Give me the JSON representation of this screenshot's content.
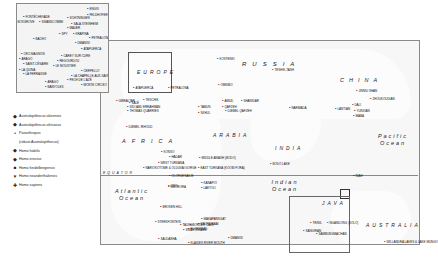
{
  "legend": {
    "items": [
      {
        "symbol": "◆",
        "label": "Australopithecus afarensis"
      },
      {
        "symbol": "◆",
        "label": "Australopithecus africanus"
      },
      {
        "symbol": "•",
        "label": "Paranthropus"
      },
      {
        "symbol": "",
        "label": "(robust Australopithecus)"
      },
      {
        "symbol": "◆",
        "label": "Homo habilis"
      },
      {
        "symbol": "◆",
        "label": "Homo erectus"
      },
      {
        "symbol": "■",
        "label": "Homo heidelbergensis"
      },
      {
        "symbol": "▼",
        "label": "Homo neanderthalensis"
      },
      {
        "symbol": "✚",
        "label": "Homo sapiens"
      }
    ]
  },
  "regions": {
    "europe": "EUROPE",
    "russia": "RUSSIA",
    "china": "CHINA",
    "africa": "AFRICA",
    "arabia": "ARABIA",
    "india": "INDIA",
    "java": "JAVA",
    "australia": "AUSTRALIA",
    "equator": "EQUATOR"
  },
  "oceans": {
    "atlantic": "Atlantic Ocean",
    "indian": "Indian Ocean",
    "pacific": "Pacific Ocean"
  },
  "europe_inset_sites": [
    {
      "name": "ENGIS",
      "x": 86,
      "y": 6
    },
    {
      "name": "FELDHOFER",
      "x": 86,
      "y": 12
    },
    {
      "name": "FONTÉCHEVADE",
      "x": 22,
      "y": 14
    },
    {
      "name": "SCHÖNINGEN",
      "x": 66,
      "y": 15
    },
    {
      "name": "BOXGROVE",
      "x": 14,
      "y": 19
    },
    {
      "name": "SWANSCOMBE",
      "x": 38,
      "y": 19
    },
    {
      "name": "SALA STEINHEIM",
      "x": 70,
      "y": 21
    },
    {
      "name": "MAUER",
      "x": 66,
      "y": 25
    },
    {
      "name": "SPY",
      "x": 58,
      "y": 31
    },
    {
      "name": "KRAPINA",
      "x": 72,
      "y": 31
    },
    {
      "name": "PETRALONA",
      "x": 88,
      "y": 35
    },
    {
      "name": "BACHO",
      "x": 32,
      "y": 36
    },
    {
      "name": "DMANISI",
      "x": 74,
      "y": 40
    },
    {
      "name": "ATAPUERCA",
      "x": 80,
      "y": 46
    },
    {
      "name": "CRO-MAGNON",
      "x": 20,
      "y": 51
    },
    {
      "name": "ARAGO",
      "x": 18,
      "y": 56
    },
    {
      "name": "CAREY SUR CURE",
      "x": 60,
      "y": 53
    },
    {
      "name": "REGOURDOU",
      "x": 56,
      "y": 58
    },
    {
      "name": "LE MOUSTIER",
      "x": 52,
      "y": 63
    },
    {
      "name": "SAINT-CÉSAIRE",
      "x": 22,
      "y": 61
    },
    {
      "name": "LA QUINA",
      "x": 18,
      "y": 67
    },
    {
      "name": "LA FERRASSIE",
      "x": 22,
      "y": 71
    },
    {
      "name": "LA CHAPELLE-AUX-SAINTS",
      "x": 70,
      "y": 73
    },
    {
      "name": "PECH DE L'AZÉ",
      "x": 66,
      "y": 77
    },
    {
      "name": "CERPELLO",
      "x": 80,
      "y": 68
    },
    {
      "name": "ARAGO",
      "x": 44,
      "y": 79
    },
    {
      "name": "MONTE CIRCEO",
      "x": 80,
      "y": 82
    },
    {
      "name": "BANYOLES",
      "x": 44,
      "y": 84
    }
  ],
  "sites": [
    {
      "name": "KOSTENKI",
      "x": 217,
      "y": 57
    },
    {
      "name": "PETRALONA",
      "x": 168,
      "y": 86
    },
    {
      "name": "OMNIBO",
      "x": 218,
      "y": 83
    },
    {
      "name": "TESHIK-TASH",
      "x": 272,
      "y": 68
    },
    {
      "name": "ATAPUERCA",
      "x": 133,
      "y": 86
    },
    {
      "name": "GIBRALTAR",
      "x": 116,
      "y": 99
    },
    {
      "name": "TESCHIK",
      "x": 143,
      "y": 98
    },
    {
      "name": "SALÉ",
      "x": 129,
      "y": 101
    },
    {
      "name": "SIDI ABD ERRAHMAN",
      "x": 127,
      "y": 105
    },
    {
      "name": "THOMAS QUARRIES",
      "x": 127,
      "y": 109
    },
    {
      "name": "DJEBEL IRHOUD",
      "x": 126,
      "y": 125
    },
    {
      "name": "AMUD",
      "x": 222,
      "y": 99
    },
    {
      "name": "SHANIDAR",
      "x": 241,
      "y": 99
    },
    {
      "name": "TABUN",
      "x": 198,
      "y": 105
    },
    {
      "name": "SKHUL",
      "x": 198,
      "y": 111
    },
    {
      "name": "QAFZEH",
      "x": 222,
      "y": 105
    },
    {
      "name": "DJEBEL QAFZEH",
      "x": 225,
      "y": 109
    },
    {
      "name": "JINNIU SHAN",
      "x": 356,
      "y": 89
    },
    {
      "name": "ZHOUKOUDIAN",
      "x": 370,
      "y": 97
    },
    {
      "name": "DALI",
      "x": 352,
      "y": 103
    },
    {
      "name": "LANTIAN",
      "x": 335,
      "y": 107
    },
    {
      "name": "YUNXIAN",
      "x": 354,
      "y": 109
    },
    {
      "name": "MABA",
      "x": 353,
      "y": 114
    },
    {
      "name": "NARMADA",
      "x": 289,
      "y": 106
    },
    {
      "name": "KONSO",
      "x": 161,
      "y": 150
    },
    {
      "name": "HADAR",
      "x": 169,
      "y": 155
    },
    {
      "name": "MIDDLE AWASH (BODO)",
      "x": 199,
      "y": 156
    },
    {
      "name": "WEST TURKANA",
      "x": 158,
      "y": 161
    },
    {
      "name": "EAST TURKANA (KOOBI FORA)",
      "x": 198,
      "y": 166
    },
    {
      "name": "NARIOKOTOME & OLDUVAI GORGE",
      "x": 143,
      "y": 166
    },
    {
      "name": "OLORGESAILIE",
      "x": 169,
      "y": 174
    },
    {
      "name": "KANAPOI",
      "x": 201,
      "y": 181
    },
    {
      "name": "LAETOLI",
      "x": 201,
      "y": 186
    },
    {
      "name": "NGORORA",
      "x": 168,
      "y": 185
    },
    {
      "name": "OMO",
      "x": 168,
      "y": 184
    },
    {
      "name": "BROKEN HILL",
      "x": 160,
      "y": 205
    },
    {
      "name": "STERKFONTEIN",
      "x": 155,
      "y": 220
    },
    {
      "name": "MAKAPANSGAT",
      "x": 201,
      "y": 217
    },
    {
      "name": "KROMDRAAI",
      "x": 198,
      "y": 222
    },
    {
      "name": "FLORISBAD",
      "x": 188,
      "y": 227
    },
    {
      "name": "BORDER CAVE",
      "x": 190,
      "y": 223
    },
    {
      "name": "TAUNG",
      "x": 180,
      "y": 223
    },
    {
      "name": "SWARTKRANS",
      "x": 183,
      "y": 228
    },
    {
      "name": "SALDANHA",
      "x": 158,
      "y": 237
    },
    {
      "name": "KLASIES RIVER MOUTH",
      "x": 188,
      "y": 241
    },
    {
      "name": "DMANISI",
      "x": 228,
      "y": 236
    },
    {
      "name": "BODO LAKE",
      "x": 270,
      "y": 162
    },
    {
      "name": "NIAH",
      "x": 353,
      "y": 174
    },
    {
      "name": "TRINIL",
      "x": 310,
      "y": 221
    },
    {
      "name": "NGANDONG (SOLO)",
      "x": 327,
      "y": 221
    },
    {
      "name": "SANGIRAN",
      "x": 303,
      "y": 229
    },
    {
      "name": "SAMBUNGMACHAN",
      "x": 316,
      "y": 232
    },
    {
      "name": "WILLANDRA LAKES & LAKE MUNGO",
      "x": 384,
      "y": 240
    }
  ]
}
